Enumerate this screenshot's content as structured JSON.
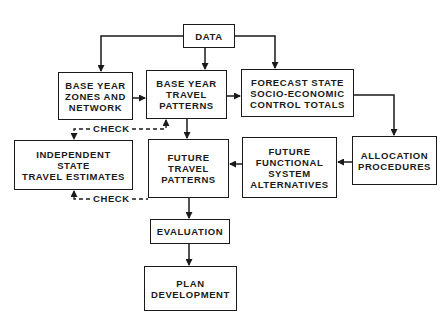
{
  "diagram": {
    "nodes": {
      "data": {
        "lines": [
          "DATA"
        ]
      },
      "base_year_zones": {
        "lines": [
          "BASE YEAR",
          "ZONES AND",
          "NETWORK"
        ]
      },
      "base_year_travel": {
        "lines": [
          "BASE YEAR",
          "TRAVEL",
          "PATTERNS"
        ]
      },
      "forecast_state": {
        "lines": [
          "FORECAST STATE",
          "SOCIO-ECONOMIC",
          "CONTROL TOTALS"
        ]
      },
      "allocation": {
        "lines": [
          "ALLOCATION",
          "PROCEDURES"
        ]
      },
      "future_functional": {
        "lines": [
          "FUTURE",
          "FUNCTIONAL",
          "SYSTEM",
          "ALTERNATIVES"
        ]
      },
      "future_travel": {
        "lines": [
          "FUTURE",
          "TRAVEL",
          "PATTERNS"
        ]
      },
      "independent_state": {
        "lines": [
          "INDEPENDENT",
          "STATE",
          "TRAVEL ESTIMATES"
        ]
      },
      "evaluation": {
        "lines": [
          "EVALUATION"
        ]
      },
      "plan_development": {
        "lines": [
          "PLAN",
          "DEVELOPMENT"
        ]
      }
    },
    "labels": {
      "check_top": "CHECK",
      "check_bottom": "CHECK"
    },
    "edges": [
      {
        "from": "DATA",
        "to": "BASE YEAR ZONES AND NETWORK"
      },
      {
        "from": "DATA",
        "to": "BASE YEAR TRAVEL PATTERNS"
      },
      {
        "from": "DATA",
        "to": "FORECAST STATE SOCIO-ECONOMIC CONTROL TOTALS"
      },
      {
        "from": "BASE YEAR ZONES AND NETWORK",
        "to": "BASE YEAR TRAVEL PATTERNS"
      },
      {
        "from": "BASE YEAR TRAVEL PATTERNS",
        "to": "FORECAST STATE SOCIO-ECONOMIC CONTROL TOTALS"
      },
      {
        "from": "FORECAST STATE SOCIO-ECONOMIC CONTROL TOTALS",
        "to": "ALLOCATION PROCEDURES"
      },
      {
        "from": "ALLOCATION PROCEDURES",
        "to": "FUTURE FUNCTIONAL SYSTEM ALTERNATIVES"
      },
      {
        "from": "FUTURE FUNCTIONAL SYSTEM ALTERNATIVES",
        "to": "FUTURE TRAVEL PATTERNS"
      },
      {
        "from": "BASE YEAR TRAVEL PATTERNS",
        "to": "FUTURE TRAVEL PATTERNS"
      },
      {
        "from": "FUTURE TRAVEL PATTERNS",
        "to": "EVALUATION"
      },
      {
        "from": "EVALUATION",
        "to": "PLAN DEVELOPMENT"
      },
      {
        "from": "INDEPENDENT STATE TRAVEL ESTIMATES",
        "to": "BASE YEAR TRAVEL PATTERNS",
        "label": "CHECK",
        "style": "dashed",
        "bidirectional": true
      },
      {
        "from": "FUTURE TRAVEL PATTERNS",
        "to": "INDEPENDENT STATE TRAVEL ESTIMATES",
        "label": "CHECK",
        "style": "dashed"
      }
    ]
  }
}
